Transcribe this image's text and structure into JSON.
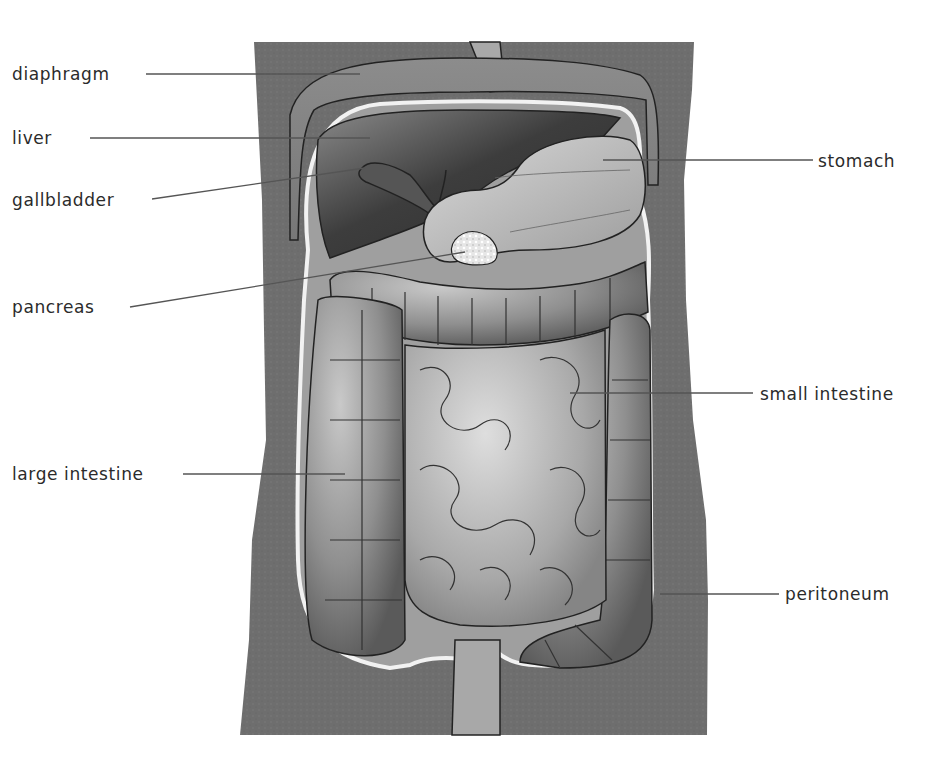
{
  "diagram": {
    "colors": {
      "torso": "#6e6e6e",
      "organ_light": "#bdbdbd",
      "organ_mid": "#9a9a9a",
      "organ_dark": "#4a4a4a",
      "liver_dark": "#3a3a3a",
      "outline": "#222222",
      "peritoneum": "#eeeeee",
      "leader_line": "#555555",
      "label_text": "#2b2b2b"
    },
    "labels": {
      "diaphragm": {
        "text": "diaphragm",
        "side": "left",
        "x": 41,
        "y": 62
      },
      "liver": {
        "text": "liver",
        "side": "left",
        "x": 41,
        "y": 130
      },
      "gallbladder": {
        "text": "gallbladder",
        "side": "left",
        "x": 41,
        "y": 192
      },
      "pancreas": {
        "text": "pancreas",
        "side": "left",
        "x": 41,
        "y": 298
      },
      "large_intestine": {
        "text": "large intestine",
        "side": "left",
        "x": 41,
        "y": 465
      },
      "stomach": {
        "text": "stomach",
        "side": "right",
        "x": 820,
        "y": 153
      },
      "small_intestine": {
        "text": "small intestine",
        "side": "right",
        "x": 760,
        "y": 385
      },
      "peritoneum": {
        "text": "peritoneum",
        "side": "right",
        "x": 785,
        "y": 585
      }
    }
  }
}
